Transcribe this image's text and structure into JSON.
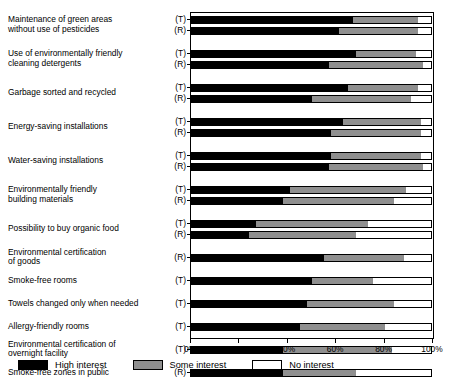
{
  "chart_data": {
    "type": "bar",
    "orientation": "horizontal",
    "stacked": true,
    "title": "",
    "xlabel": "",
    "ylabel": "",
    "xlim": [
      0,
      100
    ],
    "xticks": [
      0,
      20,
      40,
      60,
      80,
      100
    ],
    "xtick_labels": [
      "0%",
      "20%",
      "40%",
      "60%",
      "80%",
      "100%"
    ],
    "grid": false,
    "legend_position": "bottom-left",
    "series": [
      {
        "name": "High interest",
        "color": "#000000"
      },
      {
        "name": "Some interest",
        "color": "#8f8f8f"
      },
      {
        "name": "No interest",
        "color": "#ffffff"
      }
    ],
    "groups": [
      {
        "category": "Maintenance of green areas without use of pesticides",
        "category_lines": [
          "Maintenance of green areas",
          "without use of pesticides"
        ],
        "bars": [
          {
            "code": "(T)",
            "high": 67,
            "some": 27,
            "no": 6
          },
          {
            "code": "(R)",
            "high": 61,
            "some": 33,
            "no": 6
          }
        ]
      },
      {
        "category": "Use of environmentally friendly cleaning detergents",
        "category_lines": [
          "Use of environmentally friendly",
          "cleaning detergents"
        ],
        "bars": [
          {
            "code": "(T)",
            "high": 68,
            "some": 25,
            "no": 7
          },
          {
            "code": "(R)",
            "high": 57,
            "some": 39,
            "no": 4
          }
        ]
      },
      {
        "category": "Garbage sorted and recycled",
        "category_lines": [
          "Garbage sorted and recycled"
        ],
        "bars": [
          {
            "code": "(T)",
            "high": 65,
            "some": 29,
            "no": 6
          },
          {
            "code": "(R)",
            "high": 50,
            "some": 41,
            "no": 9
          }
        ]
      },
      {
        "category": "Energy-saving installations",
        "category_lines": [
          "Energy-saving installations"
        ],
        "bars": [
          {
            "code": "(T)",
            "high": 63,
            "some": 32,
            "no": 5
          },
          {
            "code": "(R)",
            "high": 58,
            "some": 37,
            "no": 5
          }
        ]
      },
      {
        "category": "Water-saving installations",
        "category_lines": [
          "Water-saving installations"
        ],
        "bars": [
          {
            "code": "(T)",
            "high": 58,
            "some": 37,
            "no": 5
          },
          {
            "code": "(R)",
            "high": 57,
            "some": 39,
            "no": 4
          }
        ]
      },
      {
        "category": "Environmentally friendly building materials",
        "category_lines": [
          "Environmentally friendly",
          "building materials"
        ],
        "bars": [
          {
            "code": "(T)",
            "high": 41,
            "some": 48,
            "no": 11
          },
          {
            "code": "(R)",
            "high": 38,
            "some": 46,
            "no": 16
          }
        ]
      },
      {
        "category": "Possibility to buy organic food",
        "category_lines": [
          "Possibility to buy organic food"
        ],
        "bars": [
          {
            "code": "(T)",
            "high": 27,
            "some": 46,
            "no": 27
          },
          {
            "code": "(R)",
            "high": 24,
            "some": 44,
            "no": 32
          }
        ]
      },
      {
        "category": "Environmental certification of goods",
        "category_lines": [
          "Environmental certification",
          "of goods"
        ],
        "bars": [
          {
            "code": "(R)",
            "high": 55,
            "some": 33,
            "no": 12
          }
        ]
      },
      {
        "category": "Smoke-free rooms",
        "category_lines": [
          "Smoke-free rooms"
        ],
        "bars": [
          {
            "code": "(T)",
            "high": 50,
            "some": 25,
            "no": 25
          }
        ]
      },
      {
        "category": "Towels changed only when needed",
        "category_lines": [
          "Towels changed only when needed"
        ],
        "bars": [
          {
            "code": "(T)",
            "high": 48,
            "some": 36,
            "no": 16
          }
        ]
      },
      {
        "category": "Allergy-friendly rooms",
        "category_lines": [
          "Allergy-friendly rooms"
        ],
        "bars": [
          {
            "code": "(T)",
            "high": 45,
            "some": 35,
            "no": 20
          }
        ]
      },
      {
        "category": "Environmental certification of overnight facility",
        "category_lines": [
          "Environmental certification of",
          "overnight facility"
        ],
        "bars": [
          {
            "code": "(T)",
            "high": 38,
            "some": 45,
            "no": 17
          }
        ]
      },
      {
        "category": "Smoke-free zones in public",
        "category_lines": [
          "Smoke-free zones in public"
        ],
        "bars": [
          {
            "code": "(R)",
            "high": 38,
            "some": 30,
            "no": 32
          }
        ]
      }
    ]
  },
  "legend": {
    "items": [
      {
        "label": "High interest",
        "swatch": "sw-high"
      },
      {
        "label": "Some interest",
        "swatch": "sw-some"
      },
      {
        "label": "No interest",
        "swatch": "sw-no"
      }
    ]
  }
}
